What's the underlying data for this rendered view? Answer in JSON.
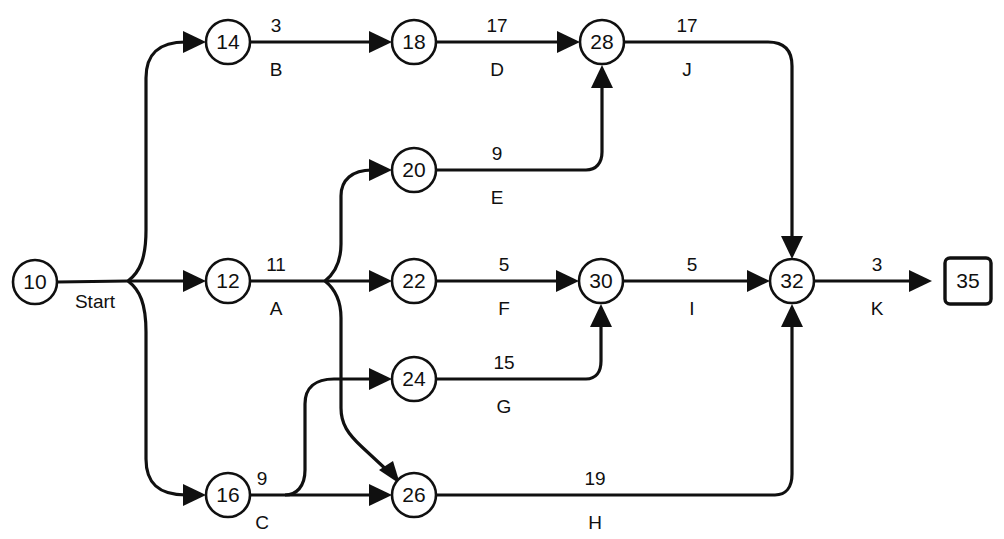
{
  "diagram": {
    "type": "network-diagram",
    "background_color": "#ffffff",
    "line_color": "#101010",
    "nodes": [
      {
        "id": "10",
        "label": "10",
        "shape": "circle",
        "x": 35,
        "y": 282,
        "r": 22
      },
      {
        "id": "12",
        "label": "12",
        "shape": "circle",
        "x": 228,
        "y": 281,
        "r": 22
      },
      {
        "id": "14",
        "label": "14",
        "shape": "circle",
        "x": 228,
        "y": 42,
        "r": 22
      },
      {
        "id": "16",
        "label": "16",
        "shape": "circle",
        "x": 228,
        "y": 495,
        "r": 22
      },
      {
        "id": "18",
        "label": "18",
        "shape": "circle",
        "x": 414,
        "y": 42,
        "r": 22
      },
      {
        "id": "20",
        "label": "20",
        "shape": "circle",
        "x": 414,
        "y": 170,
        "r": 22
      },
      {
        "id": "22",
        "label": "22",
        "shape": "circle",
        "x": 414,
        "y": 281,
        "r": 22
      },
      {
        "id": "24",
        "label": "24",
        "shape": "circle",
        "x": 414,
        "y": 379,
        "r": 22
      },
      {
        "id": "26",
        "label": "26",
        "shape": "circle",
        "x": 414,
        "y": 495,
        "r": 22
      },
      {
        "id": "28",
        "label": "28",
        "shape": "circle",
        "x": 602,
        "y": 42,
        "r": 22
      },
      {
        "id": "30",
        "label": "30",
        "shape": "circle",
        "x": 601,
        "y": 281,
        "r": 22
      },
      {
        "id": "32",
        "label": "32",
        "shape": "circle",
        "x": 792,
        "y": 281,
        "r": 22
      },
      {
        "id": "35",
        "label": "35",
        "shape": "square",
        "x": 968,
        "y": 281,
        "r": 23
      }
    ],
    "edges": [
      {
        "id": "start",
        "from": "10",
        "to": "14-12-16",
        "duration": "",
        "activity": "Start",
        "label_x": 95,
        "label_top_y": 0,
        "label_bottom_y": 302
      },
      {
        "id": "B",
        "from": "14",
        "to": "18",
        "duration": "3",
        "activity": "B",
        "label_x": 276,
        "label_top_y": 32,
        "label_bottom_y": 70
      },
      {
        "id": "D",
        "from": "18",
        "to": "28",
        "duration": "17",
        "activity": "D",
        "label_x": 497,
        "label_top_y": 32,
        "label_bottom_y": 70
      },
      {
        "id": "J",
        "from": "28",
        "to": "32",
        "duration": "17",
        "activity": "J",
        "label_x": 687,
        "label_top_y": 32,
        "label_bottom_y": 70
      },
      {
        "id": "E",
        "from": "20",
        "to": "28",
        "duration": "9",
        "activity": "E",
        "label_x": 497,
        "label_top_y": 160,
        "label_bottom_y": 198
      },
      {
        "id": "A",
        "from": "12",
        "to": "20-22-26",
        "duration": "11",
        "activity": "A",
        "label_x": 276,
        "label_top_y": 271,
        "label_bottom_y": 309
      },
      {
        "id": "F",
        "from": "22",
        "to": "30",
        "duration": "5",
        "activity": "F",
        "label_x": 504,
        "label_top_y": 271,
        "label_bottom_y": 309
      },
      {
        "id": "I",
        "from": "30",
        "to": "32",
        "duration": "5",
        "activity": "I",
        "label_x": 692,
        "label_top_y": 271,
        "label_bottom_y": 309
      },
      {
        "id": "K",
        "from": "32",
        "to": "35",
        "duration": "3",
        "activity": "K",
        "label_x": 877,
        "label_top_y": 271,
        "label_bottom_y": 309
      },
      {
        "id": "G",
        "from": "24",
        "to": "30",
        "duration": "15",
        "activity": "G",
        "label_x": 504,
        "label_top_y": 369,
        "label_bottom_y": 407
      },
      {
        "id": "C",
        "from": "16",
        "to": "24-26",
        "duration": "9",
        "activity": "C",
        "label_x": 262,
        "label_top_y": 485,
        "label_bottom_y": 523
      },
      {
        "id": "H",
        "from": "26",
        "to": "32",
        "duration": "19",
        "activity": "H",
        "label_x": 595,
        "label_top_y": 485,
        "label_bottom_y": 523
      }
    ]
  }
}
